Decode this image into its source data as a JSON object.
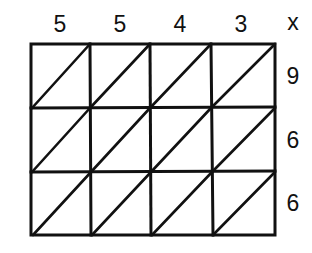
{
  "diagram": {
    "type": "lattice-multiplication-grid",
    "top_digits": [
      "5",
      "5",
      "4",
      "3"
    ],
    "operator": "x",
    "right_digits": [
      "9",
      "6",
      "6"
    ],
    "grid": {
      "columns": 4,
      "rows": 3,
      "diagonals": "bottom-left to top-right in each cell"
    },
    "line_color": "#111111"
  }
}
